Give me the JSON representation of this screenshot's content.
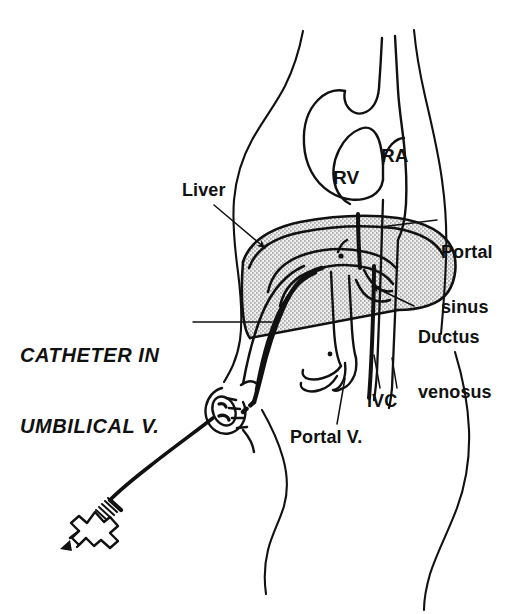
{
  "figure": {
    "type": "anatomical line drawing",
    "style": "black ink line art on white, stippled liver shading"
  },
  "labels": {
    "liver": "Liver",
    "rv": "RV",
    "ra": "RA",
    "portal_sinus_line1": "Portal",
    "portal_sinus_line2": "sinus",
    "ductus_venosus_line1": "Ductus",
    "ductus_venosus_line2": "venosus",
    "ivc": "IVC",
    "portal_v": "Portal V.",
    "catheter_line1": "CATHETER IN",
    "catheter_line2": "UMBILICAL V."
  },
  "colors": {
    "ink": "#111111",
    "paper": "#ffffff",
    "liver_stipple": "#b4b4b4",
    "liver_stipple_dark": "#8d8d8d"
  },
  "structures": [
    {
      "name": "body-outline",
      "label": null,
      "description": "infant torso profile, front at left, back at right"
    },
    {
      "name": "heart",
      "label": null,
      "description": "heart in upper chest with right ventricle and right atrium chambers"
    },
    {
      "name": "right-ventricle",
      "label": "RV"
    },
    {
      "name": "right-atrium",
      "label": "RA"
    },
    {
      "name": "liver",
      "label": "Liver",
      "fill": "stipple"
    },
    {
      "name": "umbilical-vein",
      "label": null,
      "description": "vessel running from umbilicus up into liver"
    },
    {
      "name": "portal-sinus",
      "label": "Portal sinus"
    },
    {
      "name": "ductus-venosus",
      "label": "Ductus venosus"
    },
    {
      "name": "inferior-vena-cava",
      "label": "IVC"
    },
    {
      "name": "portal-vein",
      "label": "Portal V."
    },
    {
      "name": "catheter",
      "label": "CATHETER IN UMBILICAL V.",
      "description": "thick black line entering umbilicus, through umbilical vein, ductus venosus, into IVC toward right atrium"
    },
    {
      "name": "catheter-hub",
      "label": null,
      "description": "luer stopcock connector at free end of catheter tubing"
    }
  ]
}
